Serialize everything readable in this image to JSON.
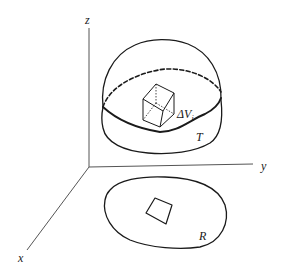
{
  "figure": {
    "axes": {
      "x_label": "x",
      "y_label": "y",
      "z_label": "z"
    },
    "solid": {
      "label": "T",
      "element_label_main": "ΔV",
      "element_label_sub": "i"
    },
    "region": {
      "label": "R"
    },
    "colors": {
      "stroke": "#1a1a1a",
      "axis": "#555555",
      "background": "#ffffff"
    }
  }
}
